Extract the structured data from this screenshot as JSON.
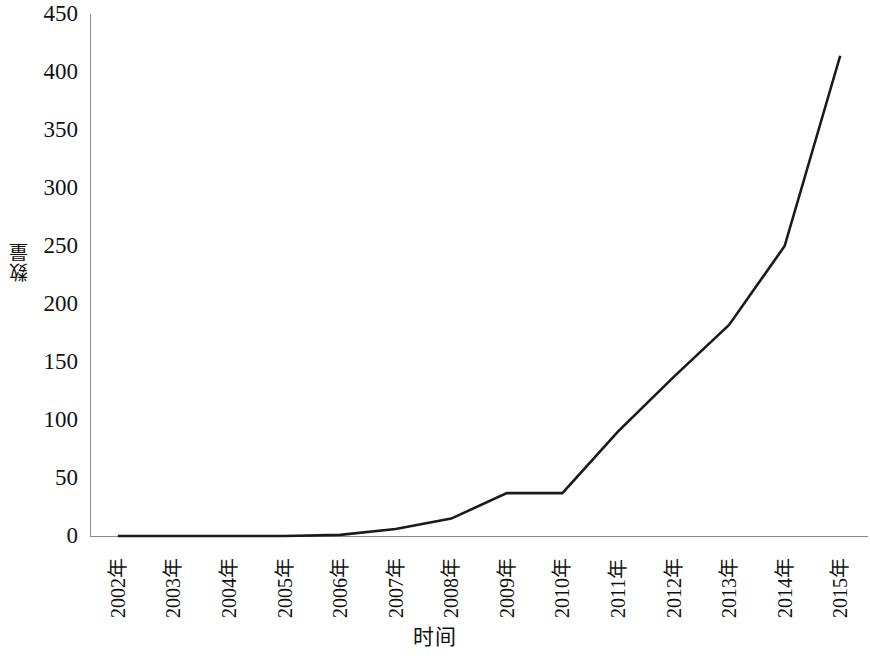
{
  "chart_data": {
    "type": "line",
    "title": "",
    "xlabel": "时间",
    "ylabel": "数量",
    "categories": [
      "2002年",
      "2003年",
      "2004年",
      "2005年",
      "2006年",
      "2007年",
      "2008年",
      "2009年",
      "2010年",
      "2011年",
      "2012年",
      "2013年",
      "2014年",
      "2015年"
    ],
    "values": [
      0,
      0,
      0,
      0,
      1,
      6,
      15,
      37,
      37,
      90,
      137,
      182,
      250,
      414
    ],
    "series": [
      {
        "name": "数量",
        "values": [
          0,
          0,
          0,
          0,
          1,
          6,
          15,
          37,
          37,
          90,
          137,
          182,
          250,
          414
        ]
      }
    ],
    "ylim": [
      0,
      450
    ],
    "ytick_labels": [
      "0",
      "50",
      "100",
      "150",
      "200",
      "250",
      "300",
      "350",
      "400",
      "450"
    ],
    "ytick_values": [
      0,
      50,
      100,
      150,
      200,
      250,
      300,
      350,
      400,
      450
    ],
    "ytick_step": 50,
    "grid": false,
    "legend": false,
    "legend_position": "none",
    "line_color": "#1a1a1a",
    "line_width": 2.5,
    "markers": false,
    "background_color": "#ffffff",
    "axis_color": "#8a8a8a",
    "xtick_rotation": -90,
    "ylabel_rotation": -90
  }
}
